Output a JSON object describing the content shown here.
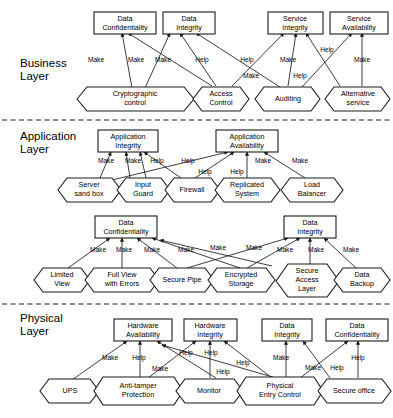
{
  "diagram": {
    "layers": [
      {
        "id": "business",
        "name": "Business Layer",
        "label_line1": "Business",
        "label_line2": "Layer",
        "goals": [
          {
            "id": "b_dc",
            "line1": "Data",
            "line2": "Confidentiality"
          },
          {
            "id": "b_di",
            "line1": "Data",
            "line2": "Integrity"
          },
          {
            "id": "b_si",
            "line1": "Service",
            "line2": "Integrity"
          },
          {
            "id": "b_sa",
            "line1": "Service",
            "line2": "Availability"
          }
        ],
        "tasks": [
          {
            "id": "b_crypto",
            "line1": "Cryptographic",
            "line2": "control"
          },
          {
            "id": "b_access",
            "line1": "Access",
            "line2": "Control"
          },
          {
            "id": "b_audit",
            "line1": "Auditing",
            "line2": ""
          },
          {
            "id": "b_alt",
            "line1": "Alternative",
            "line2": "service"
          }
        ],
        "links": [
          {
            "from": "b_crypto",
            "to": "b_dc",
            "label": "Make"
          },
          {
            "from": "b_crypto",
            "to": "b_di",
            "label": "Make"
          },
          {
            "from": "b_access",
            "to": "b_dc",
            "label": "Make"
          },
          {
            "from": "b_access",
            "to": "b_di",
            "label": "Help"
          },
          {
            "from": "b_access",
            "to": "b_si",
            "label": "Help"
          },
          {
            "from": "b_audit",
            "to": "b_di",
            "label": "Make"
          },
          {
            "from": "b_audit",
            "to": "b_si",
            "label": "Make"
          },
          {
            "from": "b_audit",
            "to": "b_sa",
            "label": "Help"
          },
          {
            "from": "b_alt",
            "to": "b_si",
            "label": "Help"
          },
          {
            "from": "b_alt",
            "to": "b_sa",
            "label": "Make"
          }
        ]
      },
      {
        "id": "application",
        "name": "Application Layer",
        "label_line1": "Application",
        "label_line2": "Layer",
        "goals": [
          {
            "id": "a_ai",
            "line1": "Application",
            "line2": "Integrity"
          },
          {
            "id": "a_aa",
            "line1": "Application",
            "line2": "Availability"
          },
          {
            "id": "a_dc",
            "line1": "Data",
            "line2": "Confidentiality"
          },
          {
            "id": "a_di",
            "line1": "Data",
            "line2": "Integrity"
          }
        ],
        "tasks": [
          {
            "id": "a_server",
            "line1": "Server",
            "line2": "sand box"
          },
          {
            "id": "a_input",
            "line1": "Input",
            "line2": "Guard"
          },
          {
            "id": "a_fw",
            "line1": "Firewall",
            "line2": ""
          },
          {
            "id": "a_repl",
            "line1": "Replicated",
            "line2": "System"
          },
          {
            "id": "a_lb",
            "line1": "Load",
            "line2": "Balancer"
          },
          {
            "id": "a_limited",
            "line1": "Limited",
            "line2": "View"
          },
          {
            "id": "a_fullview",
            "line1": "Full View",
            "line2": "with Errors"
          },
          {
            "id": "a_pipe",
            "line1": "Secure Pipe",
            "line2": ""
          },
          {
            "id": "a_encstore",
            "line1": "Encrypted",
            "line2": "Storage"
          },
          {
            "id": "a_sal",
            "line1": "Secure",
            "line2": "Access",
            "line3": "Layer"
          },
          {
            "id": "a_backup",
            "line1": "Data",
            "line2": "Backup"
          }
        ],
        "links": [
          {
            "from": "a_server",
            "to": "a_ai",
            "label": "Make"
          },
          {
            "from": "a_input",
            "to": "a_ai",
            "label": "Make"
          },
          {
            "from": "a_input",
            "to": "a_ai",
            "label": "Help"
          },
          {
            "from": "a_fw",
            "to": "a_ai",
            "label": "Help"
          },
          {
            "from": "a_server",
            "to": "a_aa",
            "label": "Help"
          },
          {
            "from": "a_fw",
            "to": "a_aa",
            "label": "Help"
          },
          {
            "from": "a_repl",
            "to": "a_aa",
            "label": "Make"
          },
          {
            "from": "a_lb",
            "to": "a_aa",
            "label": "Make"
          },
          {
            "from": "a_limited",
            "to": "a_dc",
            "label": "Make"
          },
          {
            "from": "a_fullview",
            "to": "a_dc",
            "label": "Make"
          },
          {
            "from": "a_pipe",
            "to": "a_dc",
            "label": "Make"
          },
          {
            "from": "a_encstore",
            "to": "a_dc",
            "label": "Make"
          },
          {
            "from": "a_sal",
            "to": "a_dc",
            "label": "Make"
          },
          {
            "from": "a_pipe",
            "to": "a_di",
            "label": "Make"
          },
          {
            "from": "a_encstore",
            "to": "a_di",
            "label": "Make"
          },
          {
            "from": "a_sal",
            "to": "a_di",
            "label": "Make"
          },
          {
            "from": "a_backup",
            "to": "a_di",
            "label": "Make"
          }
        ]
      },
      {
        "id": "physical",
        "name": "Physical Layer",
        "label_line1": "Physical",
        "label_line2": "Layer",
        "goals": [
          {
            "id": "p_ha",
            "line1": "Hardware",
            "line2": "Availability"
          },
          {
            "id": "p_hi",
            "line1": "Hardware",
            "line2": "Integrity"
          },
          {
            "id": "p_di",
            "line1": "Data",
            "line2": "Integrity"
          },
          {
            "id": "p_dc",
            "line1": "Data",
            "line2": "Confidentiality"
          }
        ],
        "tasks": [
          {
            "id": "p_ups",
            "line1": "UPS",
            "line2": ""
          },
          {
            "id": "p_anti",
            "line1": "Anti-tamper",
            "line2": "Protection"
          },
          {
            "id": "p_monitor",
            "line1": "Monitor",
            "line2": ""
          },
          {
            "id": "p_entry",
            "line1": "Physical",
            "line2": "Entry Control"
          },
          {
            "id": "p_office",
            "line1": "Secure office",
            "line2": ""
          }
        ],
        "links": [
          {
            "from": "p_ups",
            "to": "p_ha",
            "label": "Make"
          },
          {
            "from": "p_anti",
            "to": "p_ha",
            "label": "Help"
          },
          {
            "from": "p_monitor",
            "to": "p_ha",
            "label": "Help"
          },
          {
            "from": "p_entry",
            "to": "p_ha",
            "label": "Help"
          },
          {
            "from": "p_anti",
            "to": "p_hi",
            "label": "Make"
          },
          {
            "from": "p_monitor",
            "to": "p_hi",
            "label": "Help"
          },
          {
            "from": "p_entry",
            "to": "p_hi",
            "label": "Help"
          },
          {
            "from": "p_entry",
            "to": "p_di",
            "label": "Make"
          },
          {
            "from": "p_office",
            "to": "p_di",
            "label": "Make"
          },
          {
            "from": "p_entry",
            "to": "p_dc",
            "label": "Help"
          },
          {
            "from": "p_office",
            "to": "p_dc",
            "label": "Help"
          }
        ]
      }
    ],
    "contribution_labels": {
      "make": "Make",
      "help": "Help"
    },
    "colors": {
      "stroke": "#1a1a1a",
      "fill": "#ffffff",
      "text": "#000000"
    }
  }
}
